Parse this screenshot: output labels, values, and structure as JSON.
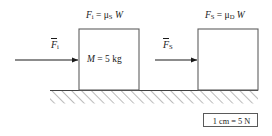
{
  "figure": {
    "background_color": "#ffffff",
    "stroke_color": "#404040",
    "text_color": "#1a1a1a"
  },
  "blocks": [
    {
      "id": "block-static",
      "label": "M = 5 kg",
      "label_mass_symbol": "M",
      "label_value": "= 5 kg",
      "top_label": {
        "force_symbol": "F",
        "force_subscript": "i",
        "equals": "=",
        "mu_symbol": "μ",
        "mu_subscript": "S",
        "weight_symbol": "W",
        "full_text": "Fᵢ = μₛ W"
      },
      "x": 79,
      "y": 29,
      "width": 60,
      "height": 61
    },
    {
      "id": "block-dynamic",
      "label": "",
      "top_label": {
        "force_symbol": "F",
        "force_subscript": "S",
        "equals": "=",
        "mu_symbol": "μ",
        "mu_subscript": "D",
        "weight_symbol": "W",
        "full_text": "Fₛ = μᴰ W"
      },
      "x": 198,
      "y": 29,
      "width": 60,
      "height": 61
    }
  ],
  "arrows": [
    {
      "id": "arrow-applied-static",
      "label_symbol": "F",
      "label_subscript": "i",
      "overbar": true,
      "x_start": 15,
      "x_end": 79,
      "y": 60
    },
    {
      "id": "arrow-applied-dynamic",
      "label_symbol": "F",
      "label_subscript": "S",
      "overbar": true,
      "x_start": 155,
      "x_end": 198,
      "y": 60
    }
  ],
  "ground": {
    "id": "hatched-ground",
    "x_start": 50,
    "x_end": 258,
    "y": 90,
    "hatch_depth": 13,
    "hatch_direction": "forward-slash"
  },
  "scale_legend": {
    "text": "1 cm = 5 N",
    "distance": "1 cm",
    "equals": "=",
    "force": "5 N"
  }
}
